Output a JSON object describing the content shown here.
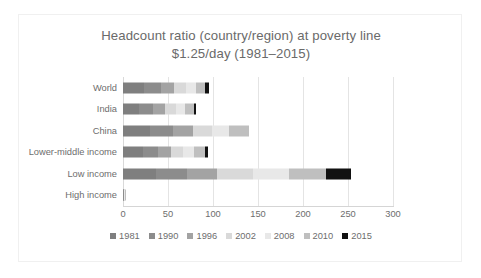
{
  "chart_data": {
    "type": "bar",
    "orientation": "horizontal",
    "stacked": true,
    "title": "Headcount ratio (country/region) at poverty line $1.25/day (1981–2015)",
    "title_line1": "Headcount ratio (country/region) at poverty line",
    "title_line2": "$1.25/day (1981–2015)",
    "xlabel": "",
    "ylabel": "",
    "xlim": [
      0,
      300
    ],
    "xticks": [
      "0",
      "50",
      "100",
      "150",
      "200",
      "250",
      "300"
    ],
    "xtick_values": [
      0,
      50,
      100,
      150,
      200,
      250,
      300
    ],
    "grid": true,
    "grid_axis": "x",
    "legend_position": "bottom",
    "categories": [
      "World",
      "India",
      "China",
      "Lower-middle income",
      "Low income",
      "High income"
    ],
    "series": [
      {
        "name": "1981",
        "color": "#7f7f7f",
        "values": [
          23.5,
          18.0,
          30.5,
          22.0,
          37.0,
          0.5
        ]
      },
      {
        "name": "1990",
        "color": "#8c8c8c",
        "values": [
          18.5,
          15.0,
          25.0,
          17.0,
          34.0,
          0.4
        ]
      },
      {
        "name": "1996",
        "color": "#a3a3a3",
        "values": [
          15.0,
          13.5,
          22.5,
          14.0,
          34.0,
          0.4
        ]
      },
      {
        "name": "2002",
        "color": "#d9d9d9",
        "values": [
          13.0,
          12.0,
          21.0,
          13.5,
          40.0,
          0.3
        ]
      },
      {
        "name": "2008",
        "color": "#e8e8e8",
        "values": [
          11.0,
          10.5,
          19.0,
          12.0,
          39.0,
          0.2
        ]
      },
      {
        "name": "2010",
        "color": "#bfbfbf",
        "values": [
          10.0,
          9.5,
          22.0,
          12.5,
          42.0,
          0.2
        ]
      },
      {
        "name": "2015",
        "color": "#111111",
        "values": [
          5.0,
          2.5,
          0.0,
          3.5,
          27.0,
          0.0
        ]
      }
    ],
    "totals": [
      96.0,
      81.0,
      140.0,
      94.5,
      253.0,
      2.0
    ]
  }
}
